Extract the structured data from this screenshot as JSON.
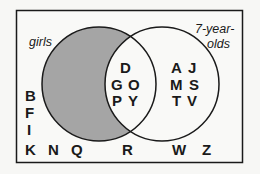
{
  "diagram": {
    "type": "venn",
    "sets": [
      {
        "name": "girls",
        "label": "girls",
        "shaded_region": "girls only (not 7-year-olds)"
      },
      {
        "name": "7-year-olds",
        "label_line1": "7-year-",
        "label_line2": "olds"
      }
    ],
    "colors": {
      "shade": "#a5a5a5",
      "stroke": "#1a1a1a",
      "background": "#f7f7f5"
    },
    "regions": {
      "girls_only": [],
      "intersection": [
        "D",
        "G",
        "O",
        "P",
        "Y"
      ],
      "seven_year_olds_only": [
        "A",
        "J",
        "M",
        "S",
        "T",
        "V"
      ],
      "outside": [
        "B",
        "F",
        "I",
        "K",
        "N",
        "Q",
        "R",
        "W",
        "Z"
      ]
    },
    "letters": {
      "D": "D",
      "G": "G",
      "O": "O",
      "P": "P",
      "Y": "Y",
      "A": "A",
      "J": "J",
      "M": "M",
      "S": "S",
      "T": "T",
      "V": "V",
      "B": "B",
      "F": "F",
      "I": "I",
      "K": "K",
      "N": "N",
      "Q": "Q",
      "R": "R",
      "W": "W",
      "Z": "Z"
    }
  }
}
